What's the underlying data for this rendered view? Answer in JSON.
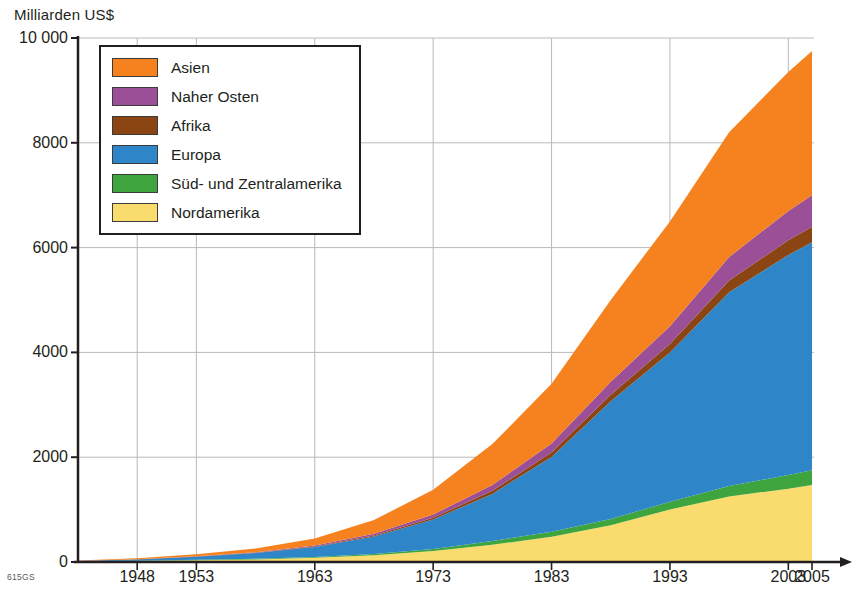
{
  "chart_data": {
    "type": "area",
    "stacked": true,
    "title": "",
    "ylabel": "Milliarden US$",
    "xlabel": "",
    "ylim": [
      0,
      10000
    ],
    "yticks": [
      0,
      2000,
      4000,
      6000,
      8000,
      10000
    ],
    "ytick_labels": [
      "0",
      "2000",
      "4000",
      "6000",
      "8000",
      "10 000"
    ],
    "xlim": [
      1943,
      2005
    ],
    "xticks": [
      1948,
      1953,
      1963,
      1973,
      1983,
      1993,
      2003,
      2005
    ],
    "xtick_labels": [
      "1948",
      "1953",
      "1963",
      "1973",
      "1983",
      "1993",
      "2003",
      "2005"
    ],
    "grid": true,
    "legend_position": "upper-left",
    "x": [
      1943,
      1948,
      1953,
      1958,
      1963,
      1968,
      1973,
      1978,
      1983,
      1988,
      1993,
      1998,
      2003,
      2005
    ],
    "series": [
      {
        "name": "Nordamerika",
        "color": "#FADB6E",
        "values": [
          10,
          20,
          35,
          50,
          80,
          130,
          210,
          330,
          480,
          700,
          1000,
          1250,
          1400,
          1470
        ]
      },
      {
        "name": "Süd- und Zentralamerika",
        "color": "#3EA43E",
        "values": [
          2,
          4,
          7,
          10,
          15,
          25,
          40,
          70,
          95,
          120,
          150,
          200,
          260,
          280
        ]
      },
      {
        "name": "Europa",
        "color": "#2E86C8",
        "values": [
          8,
          25,
          60,
          110,
          190,
          330,
          560,
          900,
          1430,
          2250,
          2850,
          3700,
          4200,
          4350
        ]
      },
      {
        "name": "Afrika",
        "color": "#8B4513",
        "values": [
          1,
          2,
          4,
          7,
          12,
          20,
          35,
          60,
          85,
          120,
          160,
          220,
          280,
          300
        ]
      },
      {
        "name": "Naher Osten",
        "color": "#9B4F96",
        "values": [
          1,
          3,
          6,
          10,
          18,
          32,
          60,
          110,
          170,
          250,
          340,
          450,
          560,
          600
        ]
      },
      {
        "name": "Asien",
        "color": "#F5821F",
        "values": [
          5,
          16,
          38,
          73,
          135,
          263,
          475,
          780,
          1140,
          1560,
          2000,
          2380,
          2650,
          2750
        ]
      }
    ],
    "legend_entries": [
      {
        "label": "Asien",
        "color": "#F5821F"
      },
      {
        "label": "Naher Osten",
        "color": "#9B4F96"
      },
      {
        "label": "Afrika",
        "color": "#8B4513"
      },
      {
        "label": "Europa",
        "color": "#2E86C8"
      },
      {
        "label": "Süd- und Zentralamerika",
        "color": "#3EA43E"
      },
      {
        "label": "Nordamerika",
        "color": "#FADB6E"
      }
    ],
    "source_code": "615GS"
  }
}
